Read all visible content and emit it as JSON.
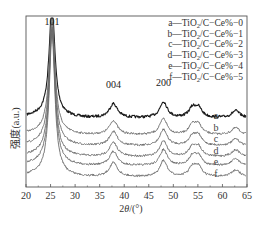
{
  "chart_data": {
    "type": "line",
    "title": "",
    "xlabel": "2θ/(°)",
    "ylabel": "强度(a.u.)",
    "xlim": [
      20,
      65
    ],
    "xticks": [
      20,
      25,
      30,
      35,
      40,
      45,
      50,
      55,
      60,
      65
    ],
    "yticks": [],
    "grid": false,
    "legend_position": "upper right",
    "legend": [
      "a—TiO2/C−Ce%−0",
      "b—TiO2/C−Ce%−1",
      "c—TiO2/C−Ce%−2",
      "d—TiO2/C−Ce%−3",
      "e—TiO2/C−Ce%−4",
      "f—TiO2/C−Ce%−5"
    ],
    "annotations": [
      {
        "text": "101",
        "x": 25.3
      },
      {
        "text": "004",
        "x": 37.8
      },
      {
        "text": "200",
        "x": 48.0
      }
    ],
    "peaks": [
      {
        "hkl": "101",
        "position": 25.3,
        "relative_height": 1.0,
        "width": 0.7
      },
      {
        "hkl": "004",
        "position": 37.8,
        "relative_height": 0.12,
        "width": 1.0
      },
      {
        "hkl": "200",
        "position": 48.0,
        "relative_height": 0.15,
        "width": 0.9
      },
      {
        "hkl": "105",
        "position": 53.9,
        "relative_height": 0.09,
        "width": 0.9
      },
      {
        "hkl": "211",
        "position": 55.1,
        "relative_height": 0.09,
        "width": 0.9
      },
      {
        "hkl": "204",
        "position": 62.7,
        "relative_height": 0.06,
        "width": 1.0
      }
    ],
    "series": [
      {
        "name": "a",
        "label": "a",
        "offset": 118,
        "color": "#1a1a1a"
      },
      {
        "name": "b",
        "label": "b",
        "offset": 135,
        "color": "#6a6a6a"
      },
      {
        "name": "c",
        "label": "c",
        "offset": 146,
        "color": "#6a6a6a"
      },
      {
        "name": "d",
        "label": "d",
        "offset": 157,
        "color": "#6a6a6a"
      },
      {
        "name": "e",
        "label": "e",
        "offset": 166,
        "color": "#6a6a6a"
      },
      {
        "name": "f",
        "label": "f",
        "offset": 177,
        "color": "#6a6a6a"
      }
    ]
  },
  "legend": {
    "items": [
      {
        "prefix": "a—TiO",
        "sub": "2",
        "suffix": "/C−Ce%−0"
      },
      {
        "prefix": "b—TiO",
        "sub": "2",
        "suffix": "/C−Ce%−1"
      },
      {
        "prefix": "c—TiO",
        "sub": "2",
        "suffix": "/C−Ce%−2"
      },
      {
        "prefix": "d—TiO",
        "sub": "2",
        "suffix": "/C−Ce%−3"
      },
      {
        "prefix": "e—TiO",
        "sub": "2",
        "suffix": "/C−Ce%−4"
      },
      {
        "prefix": "f—TiO",
        "sub": "2",
        "suffix": "/C−Ce%−5"
      }
    ]
  },
  "axes": {
    "xlabel_main": "2",
    "xlabel_theta": "θ",
    "xlabel_unit": "/(°)",
    "ylabel": "强度(a.u.)"
  },
  "colors": {
    "axis": "#555555",
    "curve_a": "#1a1a1a",
    "curve_other": "#6a6a6a"
  }
}
